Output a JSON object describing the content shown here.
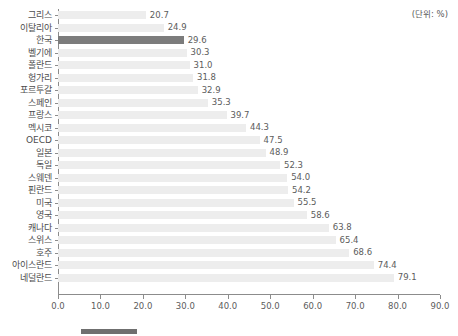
{
  "unit_note": "(단위: %)",
  "chart_data": {
    "type": "bar",
    "orientation": "horizontal",
    "title": "",
    "subtitle": "",
    "xlabel": "",
    "ylabel": "",
    "xlim": [
      0.0,
      90.0
    ],
    "xticks": [
      "0.0",
      "10.0",
      "20.0",
      "30.0",
      "40.0",
      "50.0",
      "60.0",
      "70.0",
      "80.0",
      "90.0"
    ],
    "xtick_values": [
      0,
      10,
      20,
      30,
      40,
      50,
      60,
      70,
      80,
      90
    ],
    "grid": false,
    "legend_position": "bottom",
    "unit": "(단위: %)",
    "highlight_category": "한국",
    "bar_color": "#ededed",
    "highlight_color": "#7c7c7c",
    "axis_color": "#8c8c8c",
    "text_color": "#5c5c5c",
    "categories": [
      "그리스",
      "이탈리아",
      "한국",
      "벨기에",
      "폴란드",
      "헝가리",
      "포르투갈",
      "스페인",
      "프랑스",
      "멕시코",
      "OECD",
      "일본",
      "독일",
      "스웨덴",
      "핀란드",
      "미국",
      "영국",
      "캐나다",
      "스위스",
      "호주",
      "아이스란드",
      "네덜란드"
    ],
    "values": [
      20.7,
      24.9,
      29.6,
      30.3,
      31.0,
      31.8,
      32.9,
      35.3,
      39.7,
      44.3,
      47.5,
      48.9,
      52.3,
      54.0,
      54.2,
      55.5,
      58.6,
      63.8,
      65.4,
      68.6,
      74.4,
      79.1
    ],
    "value_labels": [
      "20.7",
      "24.9",
      "29.6",
      "30.3",
      "31.0",
      "31.8",
      "32.9",
      "35.3",
      "39.7",
      "44.3",
      "47.5",
      "48.9",
      "52.3",
      "54.0",
      "54.2",
      "55.5",
      "58.6",
      "63.8",
      "65.4",
      "68.6",
      "74.4",
      "79.1"
    ]
  }
}
